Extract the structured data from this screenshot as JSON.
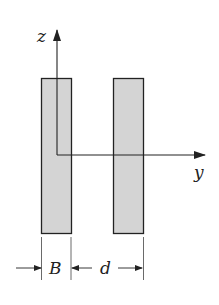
{
  "diagram": {
    "axes": {
      "vertical_label": "z",
      "horizontal_label": "y"
    },
    "plates": [
      {
        "name": "left-plate",
        "fill": "#d4d4d4"
      },
      {
        "name": "right-plate",
        "fill": "#d4d4d4"
      }
    ],
    "dimensions": {
      "width_label": "B",
      "gap_label": "d"
    },
    "colors": {
      "stroke": "#222222",
      "fill": "#d4d4d4"
    }
  }
}
